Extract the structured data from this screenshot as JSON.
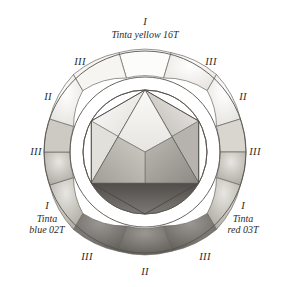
{
  "figure": {
    "type": "color-wheel-diagram",
    "background_color": "#ffffff",
    "ink_color": "#2b2b2b",
    "center": {
      "x": 145,
      "y": 152
    },
    "outer_radius": 101,
    "ring_inner_radius": 75,
    "inner_circle_radius": 62,
    "hexagon_radius": 62,
    "ring_sector_count": 12,
    "ring_sector_span_degrees": 30
  },
  "primaries": [
    {
      "id": "yellow",
      "numeral": "I",
      "name_line1": "Tinta",
      "name_line2": "yellow 16T",
      "single_line": "Tinta yellow 16T",
      "angle_degrees": 90,
      "position": "top"
    },
    {
      "id": "blue",
      "numeral": "I",
      "name_line1": "Tinta",
      "name_line2": "blue 02T",
      "single_line": "Tinta blue 02T",
      "angle_degrees": 210,
      "position": "bottom-left"
    },
    {
      "id": "red",
      "numeral": "I",
      "name_line1": "Tinta",
      "name_line2": "red 03T",
      "single_line": "Tinta red 03T",
      "angle_degrees": 330,
      "position": "bottom-right"
    }
  ],
  "numerals": [
    {
      "text": "III",
      "position": "upper-left",
      "x": 80,
      "y": 62
    },
    {
      "text": "III",
      "position": "upper-right",
      "x": 211,
      "y": 62
    },
    {
      "text": "II",
      "position": "left-upper",
      "x": 48,
      "y": 97
    },
    {
      "text": "II",
      "position": "right-upper",
      "x": 243,
      "y": 97
    },
    {
      "text": "III",
      "position": "left-lower",
      "x": 36,
      "y": 152
    },
    {
      "text": "III",
      "position": "right-lower",
      "x": 255,
      "y": 152
    },
    {
      "text": "III",
      "position": "bottom-left-outer",
      "x": 87,
      "y": 257
    },
    {
      "text": "III",
      "position": "bottom-right-outer",
      "x": 205,
      "y": 257
    },
    {
      "text": "II",
      "position": "bottom-center",
      "x": 145,
      "y": 272
    }
  ],
  "ring_sectors": [
    {
      "index": 0,
      "center_angle": 90,
      "tone": "very-light",
      "fill": "#fbfbfa"
    },
    {
      "index": 1,
      "center_angle": 60,
      "tone": "very-light",
      "fill": "#f7f6f3"
    },
    {
      "index": 2,
      "center_angle": 30,
      "tone": "light",
      "fill": "#e9e7e2"
    },
    {
      "index": 3,
      "center_angle": 0,
      "tone": "mid-light",
      "fill": "#d6d3cc"
    },
    {
      "index": 4,
      "center_angle": 330,
      "tone": "mid",
      "fill": "#b4b0a8"
    },
    {
      "index": 5,
      "center_angle": 300,
      "tone": "mid-dark",
      "fill": "#8e8a83"
    },
    {
      "index": 6,
      "center_angle": 270,
      "tone": "dark",
      "fill": "#6f6b66"
    },
    {
      "index": 7,
      "center_angle": 240,
      "tone": "mid-dark",
      "fill": "#8a8680"
    },
    {
      "index": 8,
      "center_angle": 210,
      "tone": "mid",
      "fill": "#aaa69f"
    },
    {
      "index": 9,
      "center_angle": 180,
      "tone": "mid-light",
      "fill": "#cbc8c2"
    },
    {
      "index": 10,
      "center_angle": 150,
      "tone": "light",
      "fill": "#e4e2dd"
    },
    {
      "index": 11,
      "center_angle": 120,
      "tone": "very-light",
      "fill": "#f5f4f1"
    }
  ],
  "inner_triangle": {
    "description": "equilateral triangle inscribed in hexagon, apex at top",
    "vertices_angles": [
      90,
      210,
      330
    ],
    "facets": [
      {
        "id": "left-upper-facet",
        "fill": "#ececea"
      },
      {
        "id": "right-upper-facet",
        "fill": "#c9c6c1"
      },
      {
        "id": "lower-facet",
        "fill": "#9e9a95"
      }
    ]
  },
  "hexagon_wedges": [
    {
      "id": "top-left-wedge",
      "fill": "#efeeec"
    },
    {
      "id": "top-right-wedge",
      "fill": "#dedbd6"
    },
    {
      "id": "left-wedge",
      "fill": "#e6e4e0"
    },
    {
      "id": "right-wedge",
      "fill": "#b9b5b0"
    },
    {
      "id": "bottom-left-wedge",
      "fill": "#8d8984"
    },
    {
      "id": "bottom-right-wedge",
      "fill": "#7d7974"
    }
  ],
  "center_lobes": [
    {
      "id": "lobe-yellow",
      "angle": 90,
      "fill": "#f2f1ee"
    },
    {
      "id": "lobe-red",
      "angle": 330,
      "fill": "#a6a29c"
    },
    {
      "id": "lobe-blue",
      "angle": 210,
      "fill": "#b9b6b1"
    }
  ]
}
